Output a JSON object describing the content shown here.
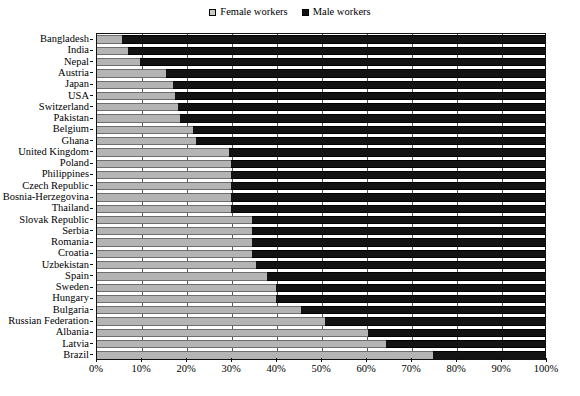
{
  "legend": {
    "position": "top-center",
    "entries": [
      {
        "label": "Female workers",
        "color": "#b4b4b4",
        "icon": "square-swatch-icon"
      },
      {
        "label": "Male workers",
        "color": "#131313",
        "icon": "square-swatch-icon"
      }
    ]
  },
  "axis": {
    "x_ticks": [
      "0%",
      "10%",
      "20%",
      "30%",
      "40%",
      "50%",
      "60%",
      "70%",
      "80%",
      "90%",
      "100%"
    ]
  },
  "chart_data": {
    "type": "bar",
    "orientation": "horizontal",
    "stacked": true,
    "normalized": true,
    "title": "",
    "subtitle": "",
    "xlabel": "",
    "ylabel": "",
    "xlim": [
      0,
      100
    ],
    "grid": true,
    "legend_position": "top-center",
    "categories": [
      "Bangladesh",
      "India",
      "Nepal",
      "Austria",
      "Japan",
      "USA",
      "Switzerland",
      "Pakistan",
      "Belgium",
      "Ghana",
      "United Kingdom",
      "Poland",
      "Philippines",
      "Czech Republic",
      "Bosnia-Herzegovina",
      "Thailand",
      "Slovak Republic",
      "Serbia",
      "Romania",
      "Croatia",
      "Uzbekistan",
      "Spain",
      "Sweden",
      "Hungary",
      "Bulgaria",
      "Russian Federation",
      "Albania",
      "Latvia",
      "Brazil"
    ],
    "series": [
      {
        "name": "Female workers",
        "color": "#b4b4b4",
        "values": [
          5.5,
          7,
          9.5,
          15.5,
          17,
          17.5,
          18,
          18.5,
          21.5,
          22,
          29.5,
          30,
          30,
          30,
          30,
          30,
          34.5,
          34.5,
          34.5,
          34.5,
          35.5,
          38,
          40,
          40,
          45.5,
          51,
          60.5,
          64.5,
          75
        ]
      },
      {
        "name": "Male workers",
        "color": "#131313",
        "values": [
          94.5,
          93,
          90.5,
          84.5,
          83,
          82.5,
          82,
          81.5,
          78.5,
          78,
          70.5,
          70,
          70,
          70,
          70,
          70,
          65.5,
          65.5,
          65.5,
          65.5,
          64.5,
          62,
          60,
          60,
          54.5,
          49,
          39.5,
          35.5,
          25
        ]
      }
    ],
    "tick_labels_x": [
      "0%",
      "10%",
      "20%",
      "30%",
      "40%",
      "50%",
      "60%",
      "70%",
      "80%",
      "90%",
      "100%"
    ]
  }
}
